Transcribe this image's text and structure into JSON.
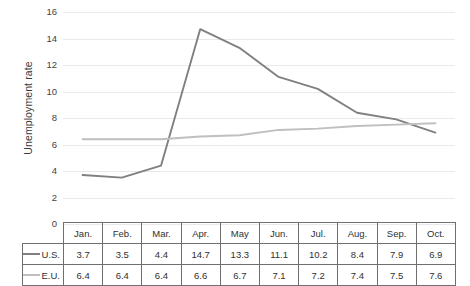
{
  "chart_data": {
    "type": "line",
    "title": "",
    "xlabel": "",
    "ylabel": "Unemployment rate",
    "ylim": [
      0,
      16
    ],
    "ytick_step": 2,
    "yticks": [
      16,
      14,
      12,
      10,
      8,
      6,
      4,
      2,
      0
    ],
    "grid": true,
    "legend_position": "data-table-row-labels",
    "categories": [
      "Jan.",
      "Feb.",
      "Mar.",
      "Apr.",
      "May",
      "Jun.",
      "Jul.",
      "Aug.",
      "Sep.",
      "Oct."
    ],
    "series": [
      {
        "name": "U.S.",
        "color": "#808080",
        "values": [
          3.7,
          3.5,
          4.4,
          14.7,
          13.3,
          11.1,
          10.2,
          8.4,
          7.9,
          6.9
        ]
      },
      {
        "name": "E.U.",
        "color": "#bfbfbf",
        "values": [
          6.4,
          6.4,
          6.4,
          6.6,
          6.7,
          7.1,
          7.2,
          7.4,
          7.5,
          7.6
        ]
      }
    ]
  },
  "table": {
    "corner_label": "",
    "header": [
      "Jan.",
      "Feb.",
      "Mar.",
      "Apr.",
      "May",
      "Jun.",
      "Jul.",
      "Aug.",
      "Sep.",
      "Oct."
    ],
    "rows": [
      {
        "label": "U.S.",
        "swatch_color": "#808080",
        "cells": [
          "3.7",
          "3.5",
          "4.4",
          "14.7",
          "13.3",
          "11.1",
          "10.2",
          "8.4",
          "7.9",
          "6.9"
        ]
      },
      {
        "label": "E.U.",
        "swatch_color": "#bfbfbf",
        "cells": [
          "6.4",
          "6.4",
          "6.4",
          "6.6",
          "6.7",
          "7.1",
          "7.2",
          "7.4",
          "7.5",
          "7.6"
        ]
      }
    ]
  },
  "axis": {
    "y_title": "Unemployment rate",
    "y_tick_labels": [
      "16",
      "14",
      "12",
      "10",
      "8",
      "6",
      "4",
      "2",
      "0"
    ]
  },
  "colors": {
    "us_line": "#808080",
    "eu_line": "#bfbfbf",
    "gridline": "#e9e9e9",
    "table_border": "#6f6f6f",
    "text": "#303030"
  }
}
